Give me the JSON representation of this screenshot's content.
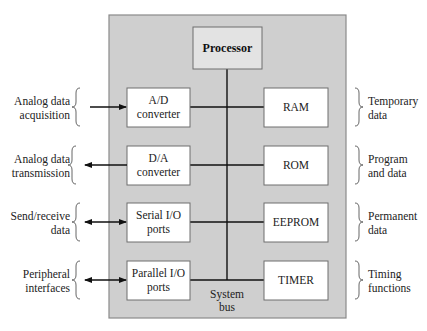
{
  "processor": {
    "label": "Processor"
  },
  "system_bus": {
    "line1": "System",
    "line2": "bus"
  },
  "left_blocks": [
    {
      "line1": "A/D",
      "line2": "converter",
      "arrow": "in",
      "ext_line1": "Analog data",
      "ext_line2": "acquisition"
    },
    {
      "line1": "D/A",
      "line2": "converter",
      "arrow": "out",
      "ext_line1": "Analog data",
      "ext_line2": "transmission"
    },
    {
      "line1": "Serial I/O",
      "line2": "ports",
      "arrow": "both",
      "ext_line1": "Send/receive",
      "ext_line2": "data"
    },
    {
      "line1": "Parallel I/O",
      "line2": "ports",
      "arrow": "both",
      "ext_line1": "Peripheral",
      "ext_line2": "interfaces"
    }
  ],
  "right_blocks": [
    {
      "label": "RAM",
      "desc_line1": "Temporary",
      "desc_line2": "data"
    },
    {
      "label": "ROM",
      "desc_line1": "Program",
      "desc_line2": "and data"
    },
    {
      "label": "EEPROM",
      "desc_line1": "Permanent",
      "desc_line2": "data"
    },
    {
      "label": "TIMER",
      "desc_line1": "Timing",
      "desc_line2": "functions"
    }
  ]
}
